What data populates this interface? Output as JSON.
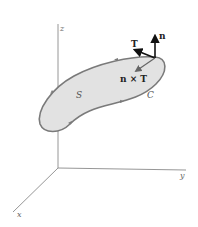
{
  "diagram": {
    "axes": {
      "x_label": "x",
      "y_label": "y",
      "z_label": "z"
    },
    "surface_label": "S",
    "curve_label": "C",
    "vectors": {
      "normal_label": "n",
      "tangent_label": "T",
      "cross_label": "n × T"
    },
    "colors": {
      "surface_fill": "#e2e2e2",
      "curve_stroke": "#7a7a7a",
      "axis_stroke": "#8a8a8a",
      "vector_stroke": "#111111",
      "cross_vector_stroke": "#666666"
    }
  }
}
